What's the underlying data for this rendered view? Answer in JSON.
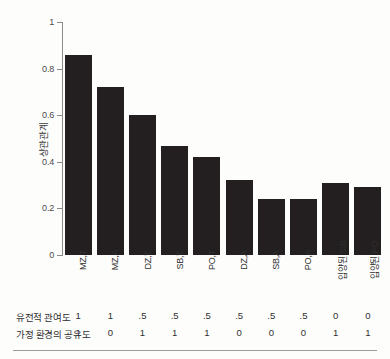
{
  "chart_data": {
    "type": "bar",
    "title": "",
    "subtitle": "",
    "xlabel": "",
    "ylabel": "상관관계",
    "ylim": [
      0,
      1
    ],
    "ytick_labels": [
      "1",
      "0.8",
      "0.6",
      "0.4",
      "0.2",
      "0"
    ],
    "ytick_values": [
      1,
      0.8,
      0.6,
      0.4,
      0.2,
      0
    ],
    "grid": false,
    "legend": null,
    "bar_color": "#231f20",
    "background_color": "#fdfdfc",
    "categories": [
      "MZ,T",
      "MZ,A",
      "DZ,T",
      "SB,T",
      "PO,T",
      "DZ,A",
      "SB,A",
      "PO,A",
      "입양된 SIB",
      "입양된 PO"
    ],
    "values": [
      0.86,
      0.72,
      0.6,
      0.47,
      0.42,
      0.32,
      0.24,
      0.24,
      0.31,
      0.29
    ],
    "annotations": {
      "rows": [
        {
          "label": "유전적 관여도",
          "values": [
            "1",
            "1",
            ".5",
            ".5",
            ".5",
            ".5",
            ".5",
            ".5",
            "0",
            "0"
          ]
        },
        {
          "label": "가정 환경의 공유도",
          "values": [
            "1",
            "0",
            "1",
            "1",
            "1",
            "0",
            "0",
            "0",
            "1",
            "1"
          ]
        }
      ]
    }
  }
}
